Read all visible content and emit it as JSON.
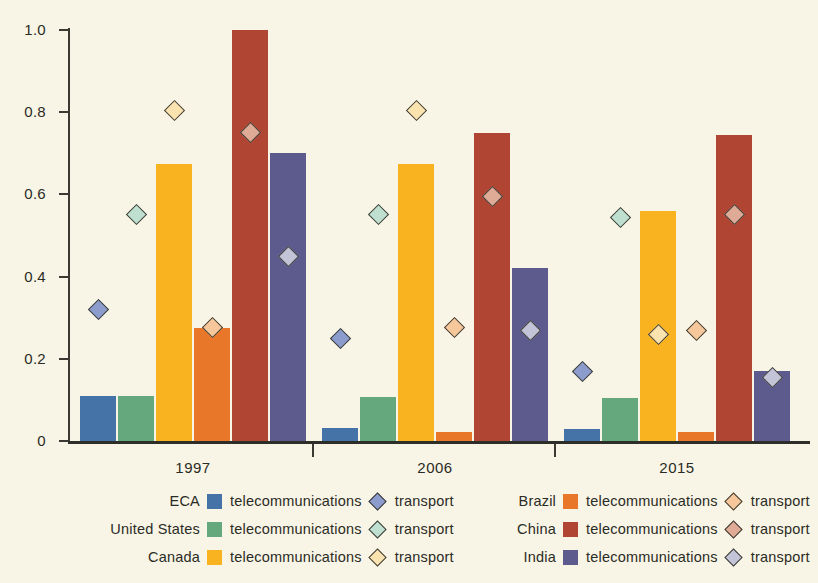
{
  "chart_data": {
    "type": "bar",
    "title": "",
    "subtitle": "",
    "xlabel": "",
    "ylabel": "",
    "categories": [
      "1997",
      "2006",
      "2015"
    ],
    "ylim": [
      0,
      1.0
    ],
    "y_ticks": [
      "0",
      "0.2",
      "0.4",
      "0.6",
      "0.8",
      "1.0"
    ],
    "y_tick_values": [
      0,
      0.2,
      0.4,
      0.6,
      0.8,
      1.0
    ],
    "grid": false,
    "legend_position": "bottom",
    "series": [
      {
        "name": "ECA",
        "metric": "telecommunications",
        "marker_metric": "transport",
        "color": "#4573a8",
        "marker_color": "#8c9ccc",
        "values": [
          0.11,
          0.032,
          0.03
        ],
        "marker_values": [
          0.32,
          0.25,
          0.17
        ]
      },
      {
        "name": "United States",
        "metric": "telecommunications",
        "marker_metric": "transport",
        "color": "#66a87e",
        "marker_color": "#bfe0d0",
        "values": [
          0.11,
          0.108,
          0.105
        ],
        "marker_values": [
          0.55,
          0.55,
          0.545
        ]
      },
      {
        "name": "Canada",
        "metric": "telecommunications",
        "marker_metric": "transport",
        "color": "#f9b320",
        "marker_color": "#fbe3b0",
        "values": [
          0.675,
          0.675,
          0.56
        ],
        "marker_values": [
          0.805,
          0.805,
          0.26
        ]
      },
      {
        "name": "Brazil",
        "metric": "telecommunications",
        "marker_metric": "transport",
        "color": "#e8772a",
        "marker_color": "#f6c79a",
        "values": [
          0.275,
          0.022,
          0.022
        ],
        "marker_values": [
          0.275,
          0.275,
          0.27
        ]
      },
      {
        "name": "China",
        "metric": "telecommunications",
        "marker_metric": "transport",
        "color": "#b14534",
        "marker_color": "#dfab96",
        "values": [
          1.0,
          0.75,
          0.745
        ],
        "marker_values": [
          0.75,
          0.595,
          0.55
        ]
      },
      {
        "name": "India",
        "metric": "telecommunications",
        "marker_metric": "transport",
        "color": "#5d5a8e",
        "marker_color": "#c3c4d8",
        "values": [
          0.7,
          0.42,
          0.17
        ],
        "marker_values": [
          0.45,
          0.27,
          0.155
        ]
      }
    ]
  },
  "axis": {
    "y_labels": [
      "1.0",
      "0.8",
      "0.6",
      "0.4",
      "0.2",
      "0"
    ],
    "x_labels": [
      "1997",
      "2006",
      "2015"
    ]
  },
  "legend": {
    "left_column": [
      {
        "region": "ECA",
        "bar_label": "telecommunications",
        "marker_label": "transport",
        "bar_color": "#4573a8",
        "marker_color": "#8c9ccc"
      },
      {
        "region": "United States",
        "bar_label": "telecommunications",
        "marker_label": "transport",
        "bar_color": "#66a87e",
        "marker_color": "#bfe0d0"
      },
      {
        "region": "Canada",
        "bar_label": "telecommunications",
        "marker_label": "transport",
        "bar_color": "#f9b320",
        "marker_color": "#fbe3b0"
      }
    ],
    "right_column": [
      {
        "region": "Brazil",
        "bar_label": "telecommunications",
        "marker_label": "transport",
        "bar_color": "#e8772a",
        "marker_color": "#f6c79a"
      },
      {
        "region": "China",
        "bar_label": "telecommunications",
        "marker_label": "transport",
        "bar_color": "#b14534",
        "marker_color": "#dfab96"
      },
      {
        "region": "India",
        "bar_label": "telecommunications",
        "marker_label": "transport",
        "bar_color": "#5d5a8e",
        "marker_color": "#c3c4d8"
      }
    ]
  },
  "colors": {
    "background": "#f8f5e6",
    "axis": "#3a3a33",
    "text": "#2b2b25"
  }
}
